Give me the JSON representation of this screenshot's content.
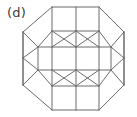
{
  "figure": {
    "panel_label": "(d)",
    "stroke_color": "#6b6b6b",
    "background_color": "#ffffff",
    "label_color": "#3c3c3c",
    "canvas": {
      "width": 137,
      "height": 117
    },
    "vertices": {
      "oct_top_left": [
        52,
        7
      ],
      "oct_top_right": [
        99,
        7
      ],
      "oct_right_top": [
        124,
        32
      ],
      "oct_right_bottom": [
        124,
        85
      ],
      "oct_bottom_right": [
        99,
        110
      ],
      "oct_bottom_left": [
        52,
        110
      ],
      "oct_left_bottom": [
        23,
        85
      ],
      "oct_left_top": [
        23,
        32
      ],
      "top_mid": [
        76,
        7
      ],
      "bottom_mid": [
        76,
        110
      ],
      "inner_tl": [
        52,
        31
      ],
      "inner_tm": [
        76,
        31
      ],
      "inner_tr": [
        99,
        31
      ],
      "inner_bl": [
        52,
        86
      ],
      "inner_bm": [
        76,
        86
      ],
      "inner_br": [
        99,
        86
      ],
      "band_l_top": [
        38,
        47
      ],
      "band_l_bot": [
        38,
        70
      ],
      "band_r_top": [
        111,
        47
      ],
      "band_r_bot": [
        111,
        70
      ],
      "mid_l_top": [
        52,
        47
      ],
      "mid_l_bot": [
        52,
        70
      ],
      "mid_c1_top": [
        76,
        47
      ],
      "mid_c1_bot": [
        76,
        70
      ],
      "mid_r_top": [
        99,
        47
      ],
      "mid_r_bot": [
        99,
        70
      ],
      "left_edge_mid": [
        23,
        58
      ],
      "right_edge_mid": [
        124,
        58
      ]
    },
    "edges": [
      {
        "name": "octagon-top",
        "path": "M52,7 L99,7"
      },
      {
        "name": "octagon-top-right-bevel",
        "path": "M99,7 L124,32"
      },
      {
        "name": "octagon-right",
        "path": "M124,32 L124,85"
      },
      {
        "name": "octagon-bottom-right-bevel",
        "path": "M124,85 L99,110"
      },
      {
        "name": "octagon-bottom",
        "path": "M99,110 L52,110"
      },
      {
        "name": "octagon-bottom-left-bevel",
        "path": "M52,110 L23,85"
      },
      {
        "name": "octagon-left",
        "path": "M23,85 L23,32"
      },
      {
        "name": "octagon-top-left-bevel",
        "path": "M23,32 L52,7"
      },
      {
        "name": "top-square-divider",
        "path": "M76,7 L76,31"
      },
      {
        "name": "top-band-base",
        "path": "M52,31 L99,31"
      },
      {
        "name": "top-square-left-side",
        "path": "M52,7 L52,31"
      },
      {
        "name": "top-square-right-side",
        "path": "M99,7 L99,31"
      },
      {
        "name": "bottom-square-divider",
        "path": "M76,86 L76,110"
      },
      {
        "name": "bottom-band-top",
        "path": "M52,86 L99,86"
      },
      {
        "name": "bottom-square-left-side",
        "path": "M52,86 L52,110"
      },
      {
        "name": "bottom-square-right-side",
        "path": "M99,86 L99,110"
      },
      {
        "name": "center-band-top",
        "path": "M38,47 L111,47"
      },
      {
        "name": "center-band-bottom",
        "path": "M38,70 L111,70"
      },
      {
        "name": "center-band-left-side",
        "path": "M38,47 L38,70"
      },
      {
        "name": "center-band-right-side",
        "path": "M111,47 L111,70"
      },
      {
        "name": "center-divider-left",
        "path": "M52,47 L52,70"
      },
      {
        "name": "center-divider-mid",
        "path": "M76,47 L76,70"
      },
      {
        "name": "center-divider-right",
        "path": "M99,47 L99,70"
      },
      {
        "name": "tri-upper-1",
        "path": "M52,31 L38,47"
      },
      {
        "name": "tri-upper-2",
        "path": "M52,31 L52,47"
      },
      {
        "name": "tri-upper-3",
        "path": "M52,31 L76,47"
      },
      {
        "name": "tri-upper-4",
        "path": "M76,31 L76,47"
      },
      {
        "name": "tri-upper-5",
        "path": "M76,31 L52,47"
      },
      {
        "name": "tri-upper-6",
        "path": "M76,31 L99,47"
      },
      {
        "name": "tri-upper-7",
        "path": "M99,31 L76,47"
      },
      {
        "name": "tri-upper-8",
        "path": "M99,31 L99,47"
      },
      {
        "name": "tri-upper-9",
        "path": "M99,31 L111,47"
      },
      {
        "name": "tri-lower-1",
        "path": "M52,86 L38,70"
      },
      {
        "name": "tri-lower-2",
        "path": "M52,86 L52,70"
      },
      {
        "name": "tri-lower-3",
        "path": "M52,86 L76,70"
      },
      {
        "name": "tri-lower-4",
        "path": "M76,86 L76,70"
      },
      {
        "name": "tri-lower-5",
        "path": "M76,86 L52,70"
      },
      {
        "name": "tri-lower-6",
        "path": "M76,86 L99,70"
      },
      {
        "name": "tri-lower-7",
        "path": "M99,86 L76,70"
      },
      {
        "name": "tri-lower-8",
        "path": "M99,86 L99,70"
      },
      {
        "name": "tri-lower-9",
        "path": "M99,86 L111,70"
      },
      {
        "name": "corner-tl-square-a",
        "path": "M23,32 L38,47"
      },
      {
        "name": "corner-tr-square-a",
        "path": "M124,32 L111,47"
      },
      {
        "name": "corner-bl-square-a",
        "path": "M23,85 L38,70"
      },
      {
        "name": "corner-br-square-a",
        "path": "M124,85 L111,70"
      },
      {
        "name": "left-fan-top",
        "path": "M23,58 L38,47"
      },
      {
        "name": "left-fan-bottom",
        "path": "M23,58 L38,70"
      },
      {
        "name": "right-fan-top",
        "path": "M124,58 L111,47"
      },
      {
        "name": "right-fan-bottom",
        "path": "M124,58 L111,70"
      },
      {
        "name": "left-edge-node-upper",
        "path": "M23,32 L23,58"
      },
      {
        "name": "left-edge-node-lower",
        "path": "M23,58 L23,85"
      },
      {
        "name": "right-edge-node-upper",
        "path": "M124,32 L124,58"
      },
      {
        "name": "right-edge-node-lower",
        "path": "M124,58 L124,85"
      }
    ]
  }
}
